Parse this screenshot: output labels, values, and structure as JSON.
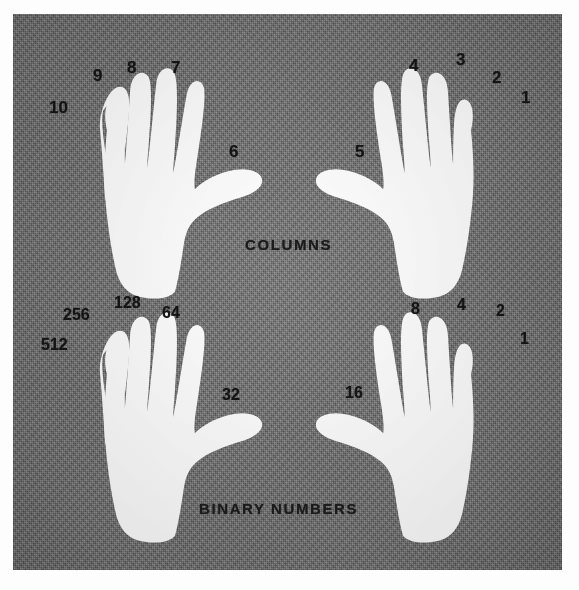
{
  "figure": {
    "kind": "halftone-photograph",
    "background_color": "#797979",
    "hand_color": "#ffffff",
    "label_color": "#141414",
    "page_color": "#fdfdfd"
  },
  "captions": {
    "columns": "COLUMNS",
    "binary_numbers": "BINARY NUMBERS"
  },
  "hands": [
    {
      "id": "top-left",
      "row": "columns",
      "side": "left",
      "digits": [
        {
          "name": "thumb",
          "label": "6"
        },
        {
          "name": "index",
          "label": "7"
        },
        {
          "name": "middle",
          "label": "8"
        },
        {
          "name": "ring",
          "label": "9"
        },
        {
          "name": "little",
          "label": "10"
        }
      ]
    },
    {
      "id": "top-right",
      "row": "columns",
      "side": "right",
      "digits": [
        {
          "name": "thumb",
          "label": "5"
        },
        {
          "name": "index",
          "label": "4"
        },
        {
          "name": "middle",
          "label": "3"
        },
        {
          "name": "ring",
          "label": "2"
        },
        {
          "name": "little",
          "label": "1"
        }
      ]
    },
    {
      "id": "bottom-left",
      "row": "binary-numbers",
      "side": "left",
      "digits": [
        {
          "name": "thumb",
          "label": "32"
        },
        {
          "name": "index",
          "label": "64"
        },
        {
          "name": "middle",
          "label": "128"
        },
        {
          "name": "ring",
          "label": "256"
        },
        {
          "name": "little",
          "label": "512"
        }
      ]
    },
    {
      "id": "bottom-right",
      "row": "binary-numbers",
      "side": "right",
      "digits": [
        {
          "name": "thumb",
          "label": "16"
        },
        {
          "name": "index",
          "label": "8"
        },
        {
          "name": "middle",
          "label": "4"
        },
        {
          "name": "ring",
          "label": "2"
        },
        {
          "name": "little",
          "label": "1"
        }
      ]
    }
  ],
  "labels": {
    "tl_little": "10",
    "tl_ring": "9",
    "tl_middle": "8",
    "tl_index": "7",
    "tl_thumb": "6",
    "tr_thumb": "5",
    "tr_index": "4",
    "tr_middle": "3",
    "tr_ring": "2",
    "tr_little": "1",
    "bl_little": "512",
    "bl_ring": "256",
    "bl_middle": "128",
    "bl_index": "64",
    "bl_thumb": "32",
    "br_thumb": "16",
    "br_index": "8",
    "br_middle": "4",
    "br_ring": "2",
    "br_little": "1"
  }
}
